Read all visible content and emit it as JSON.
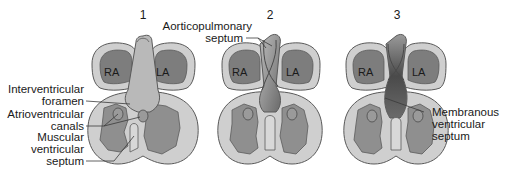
{
  "figure": {
    "panels": [
      {
        "number": "1",
        "atria": [
          "RA",
          "LA"
        ]
      },
      {
        "number": "2",
        "atria": [
          "RA",
          "LA"
        ]
      },
      {
        "number": "3",
        "atria": [
          "RA",
          "LA"
        ]
      }
    ],
    "labels": {
      "interventricular_foramen": [
        "Interventricular",
        "foramen"
      ],
      "atrioventricular_canals": [
        "Atrioventricular",
        "canals"
      ],
      "muscular_ventricular_septum": [
        "Muscular",
        "ventricular",
        "septum"
      ],
      "aorticopulmonary_septum": [
        "Aorticopulmonary",
        "septum"
      ],
      "membranous_ventricular_septum": [
        "Membranous",
        "ventricular",
        "septum"
      ]
    },
    "colors": {
      "outer_wall": "#cfcfcf",
      "outline": "#5a5a5a",
      "atria": "#7d7d7d",
      "ventricle_lumen": "#8f8f8f",
      "truncus": "#b9b9b9",
      "dark_septum": "#5e5e5e"
    }
  }
}
